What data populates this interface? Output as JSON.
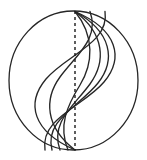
{
  "figure": {
    "background_color": "#ffffff",
    "stroke_color": "#262626",
    "axis_color": "#1c1c1c",
    "canvas": {
      "width": 147,
      "height": 160
    },
    "circle": {
      "name": "outer-circle",
      "center_x": 73.5,
      "center_y": 80.5,
      "radius_x": 64.5,
      "radius_y": 69.5,
      "stroke_width": 1.3
    },
    "axis": {
      "name": "vertical-dashed-diameter",
      "x": 75,
      "y_top": 11,
      "y_bottom": 150,
      "dash_pattern": "3 3",
      "stroke_width": 1.4
    },
    "pole_top": {
      "x": 75,
      "y": 11.5
    },
    "pole_bottom": {
      "x": 75,
      "y": 150
    },
    "curves": [
      {
        "name": "s-curve-1",
        "bulge": 0.92,
        "stroke_width": 1.35,
        "path": "M 75 11.5 C 118 30 124 58 104 82 C 84 106 40 118 45 150"
      },
      {
        "name": "s-curve-2",
        "bulge": 0.74,
        "stroke_width": 1.35,
        "path": "M 75 11.5 C 112 32 116 60 98 83 C 80 106 44 120 52 150"
      },
      {
        "name": "s-curve-3",
        "bulge": 0.56,
        "stroke_width": 1.35,
        "path": "M 75 11.5 C 105 34 106 62 90 84 C 74 106 50 122 60 150"
      },
      {
        "name": "s-curve-4",
        "bulge": 0.34,
        "stroke_width": 1.35,
        "path": "M 75 11.5 C 95 36 93 64 80 85 C 67 106 58 126 68 150"
      },
      {
        "name": "s-curve-mirror-1",
        "bulge": -0.92,
        "stroke_width": 1.35,
        "path": "M 75 150 C 32 131 26 103 46 79 C 66 55 110 43 105 11.5"
      },
      {
        "name": "s-curve-mirror-2",
        "bulge": -0.56,
        "stroke_width": 1.35,
        "path": "M 75 150 C 45 127 44 99 60 77 C 76 55 100 39 90 11.5"
      }
    ]
  }
}
